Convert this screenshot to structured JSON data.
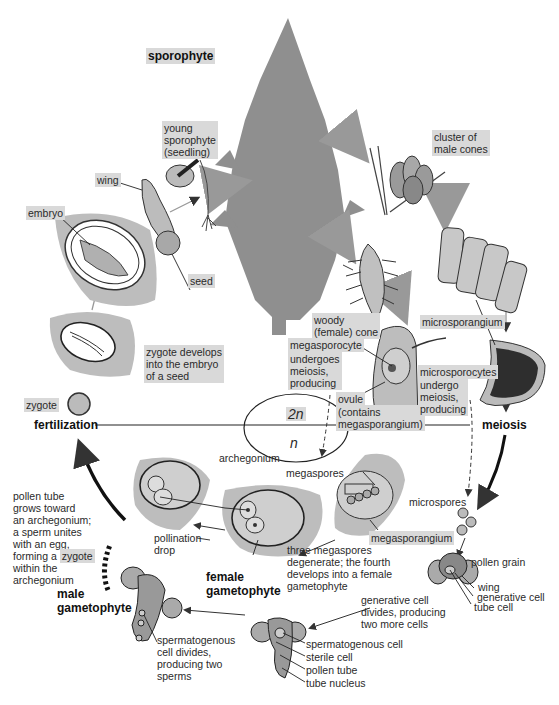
{
  "phases": {
    "diploid": "2n",
    "haploid": "n",
    "sporophyte": "sporophyte",
    "fertilization": "fertilization",
    "meiosis": "meiosis"
  },
  "labels": {
    "young_sporophyte": "young\nsporophyte\n(seedling)",
    "wing": "wing",
    "embryo": "embryo",
    "seed": "seed",
    "zygote_develops": "zygote develops\ninto the embryo\nof a seed",
    "zygote": "zygote",
    "cluster_male_cones": "cluster of\nmale cones",
    "woody_cone": "woody\n(female) cone",
    "microsporangium": "microsporangium",
    "megasporocyte": "megasporocyte",
    "megasporocyte_desc": "undergoes\nmeiosis,\nproducing",
    "ovule": "ovule",
    "ovule_desc": "(contains\nmegasporangium)",
    "microsporocytes": "microsporocytes",
    "microsporocytes_desc": "undergo\nmeiosis,\nproducing",
    "megaspores": "megaspores",
    "microspores": "microspores",
    "megasporangium": "megasporangium",
    "three_megaspores": "three megaspores\ndegenerate; the fourth\ndevelops into a female\ngametophyte",
    "archegonium": "archegonium",
    "pollination_drop": "pollination\ndrop",
    "female_gametophyte": "female\ngametophyte",
    "pollen_tube_text_1": "pollen tube\ngrows toward\nan archegonium;\na sperm unites\nwith an egg,\nforming a ",
    "pollen_tube_zygote": "zygote",
    "pollen_tube_text_2": "within the\narchegonium",
    "male_gametophyte": "male\ngametophyte",
    "spermatogenous_divides": "spermatogenous\ncell divides,\nproducing two\nsperms",
    "pollen_grain": "pollen grain",
    "pg_wing": "wing",
    "pg_generative": "generative cell",
    "pg_tube": "tube cell",
    "generative_divides": "generative cell\ndivides, producing\ntwo more cells",
    "spermatogenous_cell": "spermatogenous cell",
    "sterile_cell": "sterile cell",
    "pollen_tube": "pollen tube",
    "tube_nucleus": "tube nucleus"
  },
  "colors": {
    "tissue_gray": "#b8b8b8",
    "tree_gray": "#8f8f8f",
    "label_bg": "#d9d9d9",
    "line": "#222222"
  }
}
